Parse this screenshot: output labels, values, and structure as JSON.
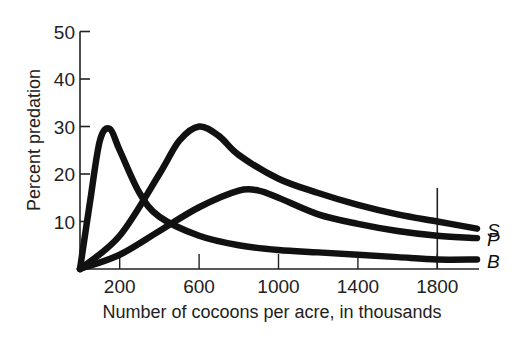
{
  "chart_data": {
    "type": "line",
    "title": "",
    "xlabel": "Number of cocoons per acre, in thousands",
    "ylabel": "Percent predation",
    "xlim": [
      0,
      2000
    ],
    "ylim": [
      0,
      50
    ],
    "x_ticks": [
      200,
      600,
      1000,
      1400,
      1800
    ],
    "x_tick_labels": [
      "200",
      "600",
      "1000",
      "1400",
      "1800"
    ],
    "y_ticks": [
      10,
      20,
      30,
      40,
      50
    ],
    "y_tick_labels": [
      "10",
      "20",
      "30",
      "40",
      "50"
    ],
    "grid": false,
    "reference_line_x": 1800,
    "legend_position": "inline-right",
    "series": [
      {
        "name": "S",
        "x": [
          0,
          200,
          400,
          500,
          600,
          700,
          800,
          1000,
          1200,
          1400,
          1600,
          1800,
          2000
        ],
        "values": [
          0,
          7,
          20,
          27,
          30,
          28,
          24,
          19,
          16,
          13.5,
          11.5,
          10,
          8.5
        ]
      },
      {
        "name": "P",
        "x": [
          0,
          200,
          400,
          600,
          800,
          900,
          1000,
          1200,
          1400,
          1600,
          1800,
          2000
        ],
        "values": [
          0,
          3,
          8,
          13,
          16.5,
          16.5,
          15,
          11.5,
          9.5,
          8,
          7,
          6.5
        ]
      },
      {
        "name": "B",
        "x": [
          0,
          50,
          100,
          150,
          200,
          300,
          400,
          600,
          800,
          1000,
          1200,
          1400,
          1600,
          1800,
          2000
        ],
        "values": [
          0,
          14,
          27,
          29.5,
          25,
          16,
          11,
          7,
          5,
          4,
          3.5,
          3,
          2.5,
          2,
          2
        ]
      }
    ]
  }
}
